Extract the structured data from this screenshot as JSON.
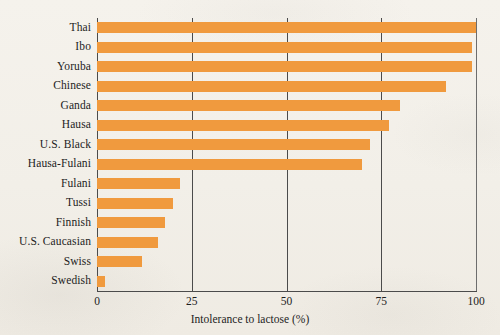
{
  "chart_data": {
    "type": "bar",
    "orientation": "horizontal",
    "title": "",
    "subtitle": "",
    "xlabel": "Intolerance to lactose (%)",
    "ylabel": "",
    "xlim": [
      0,
      100
    ],
    "xticks": [
      0,
      25,
      50,
      75,
      100
    ],
    "xtick_labels": [
      "0",
      "25",
      "50",
      "75",
      "100"
    ],
    "grid": "vertical gridlines at each x tick",
    "legend": "none",
    "bar_color": "#f09a3e",
    "categories": [
      "Thai",
      "Ibo",
      "Yoruba",
      "Chinese",
      "Ganda",
      "Hausa",
      "U.S. Black",
      "Hausa-Fulani",
      "Fulani",
      "Tussi",
      "Finnish",
      "U.S. Caucasian",
      "Swiss",
      "Swedish"
    ],
    "values": [
      100,
      99,
      99,
      92,
      80,
      77,
      72,
      70,
      22,
      20,
      18,
      16,
      12,
      2
    ],
    "series": [
      {
        "name": "Intolerance to lactose (%)",
        "values": [
          100,
          99,
          99,
          92,
          80,
          77,
          72,
          70,
          22,
          20,
          18,
          16,
          12,
          2
        ]
      }
    ]
  },
  "axis": {
    "x_title": "Intolerance to lactose (%)",
    "tick_0": "0",
    "tick_25": "25",
    "tick_50": "50",
    "tick_75": "75",
    "tick_100": "100"
  },
  "colors": {
    "bar": "#f09a3e",
    "axis": "#4b4b4b",
    "text": "#1d1d1d",
    "background": "#f3f0ea"
  }
}
